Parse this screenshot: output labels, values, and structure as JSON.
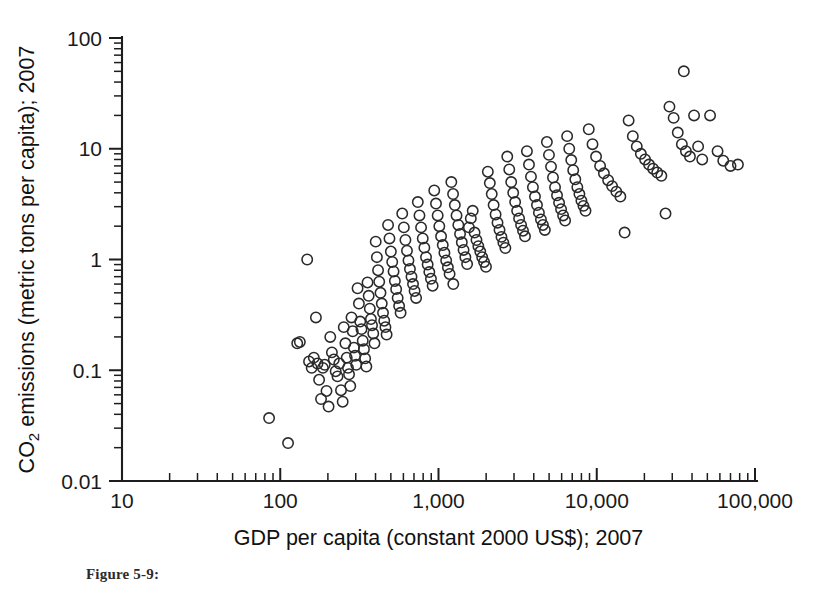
{
  "figure": {
    "caption": "Figure 5-9:",
    "background_color": "#ffffff",
    "ink_color": "#1d1d1d",
    "marker_color": "#2a2a2a"
  },
  "chart_data": {
    "type": "scatter",
    "title": "",
    "xlabel": "GDP per capita (constant 2000 US$); 2007",
    "ylabel": "CO2 emissions (metric tons per capita); 2007",
    "ylabel_parts": {
      "prefix": "CO",
      "subscript": "2",
      "suffix": " emissions (metric tons per capita); 2007"
    },
    "xscale": "log",
    "yscale": "log",
    "xlim": [
      10,
      100000
    ],
    "ylim": [
      0.01,
      100
    ],
    "grid": false,
    "legend": null,
    "xticks": [
      10,
      100,
      1000,
      10000,
      100000
    ],
    "xtick_labels": [
      "10",
      "100",
      "1,000",
      "10,000",
      "100,000"
    ],
    "yticks": [
      0.01,
      0.1,
      1,
      10,
      100
    ],
    "ytick_labels": [
      "0.01",
      "0.1",
      "1",
      "10",
      "100"
    ],
    "minor_ticks": true,
    "marker_style": "open-circle",
    "marker_radius_px": 5.2,
    "n_points": 196,
    "points": [
      [
        85,
        0.037
      ],
      [
        112,
        0.022
      ],
      [
        128,
        0.175
      ],
      [
        133,
        0.18
      ],
      [
        148,
        1.0
      ],
      [
        152,
        0.12
      ],
      [
        158,
        0.105
      ],
      [
        163,
        0.13
      ],
      [
        168,
        0.3
      ],
      [
        172,
        0.115
      ],
      [
        176,
        0.082
      ],
      [
        181,
        0.055
      ],
      [
        186,
        0.105
      ],
      [
        191,
        0.112
      ],
      [
        196,
        0.065
      ],
      [
        202,
        0.047
      ],
      [
        207,
        0.2
      ],
      [
        212,
        0.145
      ],
      [
        218,
        0.125
      ],
      [
        224,
        0.098
      ],
      [
        230,
        0.088
      ],
      [
        236,
        0.115
      ],
      [
        242,
        0.066
      ],
      [
        248,
        0.052
      ],
      [
        252,
        0.245
      ],
      [
        258,
        0.175
      ],
      [
        263,
        0.13
      ],
      [
        268,
        0.105
      ],
      [
        272,
        0.092
      ],
      [
        277,
        0.072
      ],
      [
        282,
        0.3
      ],
      [
        287,
        0.225
      ],
      [
        292,
        0.16
      ],
      [
        297,
        0.135
      ],
      [
        302,
        0.112
      ],
      [
        308,
        0.55
      ],
      [
        314,
        0.4
      ],
      [
        320,
        0.275
      ],
      [
        326,
        0.235
      ],
      [
        332,
        0.185
      ],
      [
        338,
        0.155
      ],
      [
        344,
        0.128
      ],
      [
        350,
        0.108
      ],
      [
        356,
        0.62
      ],
      [
        362,
        0.47
      ],
      [
        368,
        0.36
      ],
      [
        374,
        0.29
      ],
      [
        380,
        0.255
      ],
      [
        387,
        0.215
      ],
      [
        394,
        0.175
      ],
      [
        401,
        1.45
      ],
      [
        408,
        1.05
      ],
      [
        415,
        0.8
      ],
      [
        422,
        0.63
      ],
      [
        430,
        0.5
      ],
      [
        438,
        0.4
      ],
      [
        446,
        0.33
      ],
      [
        454,
        0.28
      ],
      [
        462,
        0.245
      ],
      [
        470,
        0.21
      ],
      [
        480,
        2.05
      ],
      [
        490,
        1.55
      ],
      [
        500,
        1.18
      ],
      [
        510,
        0.95
      ],
      [
        520,
        0.78
      ],
      [
        530,
        0.64
      ],
      [
        540,
        0.54
      ],
      [
        552,
        0.45
      ],
      [
        564,
        0.38
      ],
      [
        576,
        0.33
      ],
      [
        590,
        2.6
      ],
      [
        604,
        1.95
      ],
      [
        618,
        1.5
      ],
      [
        632,
        1.2
      ],
      [
        646,
        0.98
      ],
      [
        660,
        0.82
      ],
      [
        675,
        0.7
      ],
      [
        690,
        0.6
      ],
      [
        706,
        0.52
      ],
      [
        722,
        0.45
      ],
      [
        740,
        3.3
      ],
      [
        758,
        2.5
      ],
      [
        776,
        1.95
      ],
      [
        795,
        1.55
      ],
      [
        814,
        1.28
      ],
      [
        834,
        1.05
      ],
      [
        854,
        0.9
      ],
      [
        875,
        0.77
      ],
      [
        896,
        0.67
      ],
      [
        918,
        0.58
      ],
      [
        940,
        4.2
      ],
      [
        964,
        3.2
      ],
      [
        988,
        2.5
      ],
      [
        1012,
        2.0
      ],
      [
        1038,
        1.62
      ],
      [
        1064,
        1.35
      ],
      [
        1090,
        1.15
      ],
      [
        1118,
        0.98
      ],
      [
        1146,
        0.85
      ],
      [
        1175,
        0.74
      ],
      [
        1205,
        5.0
      ],
      [
        1236,
        3.9
      ],
      [
        1268,
        3.1
      ],
      [
        1300,
        2.5
      ],
      [
        1334,
        2.05
      ],
      [
        1368,
        1.7
      ],
      [
        1404,
        1.43
      ],
      [
        1440,
        1.22
      ],
      [
        1478,
        1.05
      ],
      [
        1516,
        0.91
      ],
      [
        1556,
        1.95
      ],
      [
        1600,
        2.35
      ],
      [
        1645,
        2.75
      ],
      [
        1690,
        1.75
      ],
      [
        1738,
        1.5
      ],
      [
        1786,
        1.32
      ],
      [
        1836,
        1.18
      ],
      [
        1888,
        1.05
      ],
      [
        1940,
        0.95
      ],
      [
        1995,
        0.86
      ],
      [
        2050,
        6.2
      ],
      [
        2110,
        4.9
      ],
      [
        2170,
        3.9
      ],
      [
        2230,
        3.1
      ],
      [
        2295,
        2.55
      ],
      [
        2360,
        2.15
      ],
      [
        2430,
        1.85
      ],
      [
        2500,
        1.6
      ],
      [
        2570,
        1.42
      ],
      [
        2645,
        1.27
      ],
      [
        2720,
        8.5
      ],
      [
        2800,
        6.5
      ],
      [
        2880,
        5.0
      ],
      [
        2965,
        4.0
      ],
      [
        3050,
        3.3
      ],
      [
        3140,
        2.75
      ],
      [
        3230,
        2.35
      ],
      [
        3325,
        2.05
      ],
      [
        3420,
        1.82
      ],
      [
        3520,
        1.62
      ],
      [
        3620,
        9.5
      ],
      [
        3730,
        7.2
      ],
      [
        3840,
        5.6
      ],
      [
        3950,
        4.5
      ],
      [
        4070,
        3.7
      ],
      [
        4190,
        3.1
      ],
      [
        4310,
        2.65
      ],
      [
        4440,
        2.3
      ],
      [
        4570,
        2.05
      ],
      [
        4700,
        1.85
      ],
      [
        4840,
        11.5
      ],
      [
        4990,
        8.8
      ],
      [
        5140,
        6.9
      ],
      [
        5290,
        5.5
      ],
      [
        5450,
        4.5
      ],
      [
        5610,
        3.8
      ],
      [
        5780,
        3.25
      ],
      [
        5950,
        2.85
      ],
      [
        6130,
        2.5
      ],
      [
        6310,
        2.25
      ],
      [
        6500,
        13.0
      ],
      [
        6700,
        10.0
      ],
      [
        6900,
        7.9
      ],
      [
        7100,
        6.4
      ],
      [
        7320,
        5.3
      ],
      [
        7540,
        4.5
      ],
      [
        7770,
        3.9
      ],
      [
        8000,
        3.4
      ],
      [
        8240,
        3.05
      ],
      [
        8490,
        2.75
      ],
      [
        8900,
        15.0
      ],
      [
        9400,
        11.0
      ],
      [
        9900,
        8.5
      ],
      [
        10500,
        7.0
      ],
      [
        11100,
        6.0
      ],
      [
        11800,
        5.2
      ],
      [
        12500,
        4.6
      ],
      [
        13300,
        4.1
      ],
      [
        14100,
        3.7
      ],
      [
        15000,
        1.75
      ],
      [
        15900,
        18.0
      ],
      [
        16900,
        13.0
      ],
      [
        17900,
        10.5
      ],
      [
        19000,
        9.0
      ],
      [
        20200,
        8.0
      ],
      [
        21400,
        7.2
      ],
      [
        22700,
        6.6
      ],
      [
        24100,
        6.1
      ],
      [
        25600,
        5.7
      ],
      [
        27200,
        2.6
      ],
      [
        28800,
        24.0
      ],
      [
        30600,
        19.0
      ],
      [
        32500,
        14.0
      ],
      [
        34500,
        11.0
      ],
      [
        35500,
        50.0
      ],
      [
        36600,
        9.5
      ],
      [
        38800,
        8.5
      ],
      [
        41200,
        20.0
      ],
      [
        43700,
        10.5
      ],
      [
        46400,
        8.0
      ],
      [
        52000,
        20.0
      ],
      [
        58000,
        9.5
      ],
      [
        63000,
        7.8
      ],
      [
        70000,
        7.0
      ],
      [
        78000,
        7.2
      ],
      [
        1240,
        0.6
      ]
    ]
  }
}
